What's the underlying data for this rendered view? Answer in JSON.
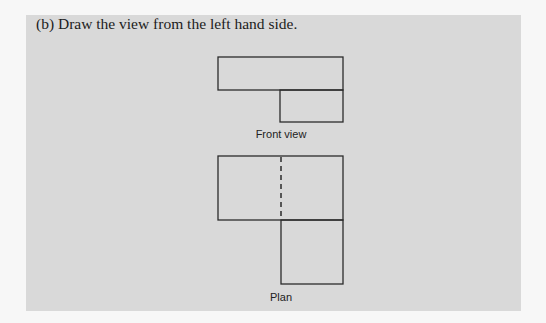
{
  "question": {
    "text": "(b) Draw the view from the left hand side."
  },
  "figures": {
    "front_view": {
      "label": "Front view",
      "shapes": [
        {
          "name": "top-block",
          "x": 218,
          "y": 57,
          "w": 125,
          "h": 33
        },
        {
          "name": "bottom-block",
          "x": 280,
          "y": 90,
          "w": 63,
          "h": 32
        }
      ]
    },
    "plan": {
      "label": "Plan",
      "shapes": [
        {
          "name": "top-block",
          "x": 218,
          "y": 156,
          "w": 125,
          "h": 64
        },
        {
          "name": "bottom-block",
          "x": 281,
          "y": 220,
          "w": 62,
          "h": 64
        }
      ],
      "hidden_line": {
        "x": 281,
        "y1": 156,
        "y2": 220,
        "style": "dashed"
      }
    }
  },
  "colors": {
    "page_background": "#f7f7f7",
    "panel_background": "#d9d9d9",
    "line": "#2b2b2b"
  }
}
